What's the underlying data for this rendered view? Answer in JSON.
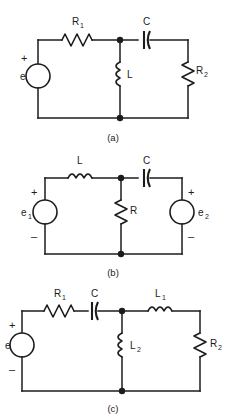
{
  "figure": {
    "type": "electrical-circuit-schematics",
    "background_color": "#ffffff",
    "line_color": "#1c1c1c",
    "panel_count": 3
  },
  "circuits": [
    {
      "id": "a",
      "caption": "(a)",
      "source": {
        "label": "e",
        "label_position": "left",
        "plus_sign": "+",
        "minus_sign": "",
        "shows_minus": false,
        "symbol": "circle-source"
      },
      "components": [
        {
          "ref": "R1",
          "label": "R",
          "subscript": "1",
          "type": "resistor",
          "orientation": "horizontal",
          "branch": "top-left",
          "label_position": "above"
        },
        {
          "ref": "C",
          "label": "C",
          "subscript": "",
          "type": "capacitor",
          "orientation": "horizontal",
          "branch": "top-right",
          "label_position": "above"
        },
        {
          "ref": "L",
          "label": "L",
          "subscript": "",
          "type": "inductor",
          "orientation": "vertical",
          "branch": "middle",
          "label_position": "right"
        },
        {
          "ref": "R2",
          "label": "R",
          "subscript": "2",
          "type": "resistor",
          "orientation": "vertical",
          "branch": "right",
          "label_position": "right"
        }
      ],
      "nodes": 2
    },
    {
      "id": "b",
      "caption": "(b)",
      "sources": [
        {
          "label": "e",
          "subscript": "1",
          "label_position": "left",
          "plus_sign": "+",
          "minus_sign": "–",
          "shows_minus": true,
          "symbol": "circle-source",
          "branch": "left"
        },
        {
          "label": "e",
          "subscript": "2",
          "label_position": "right",
          "plus_sign": "+",
          "minus_sign": "–",
          "shows_minus": true,
          "symbol": "circle-source",
          "branch": "right"
        }
      ],
      "components": [
        {
          "ref": "L",
          "label": "L",
          "subscript": "",
          "type": "inductor",
          "orientation": "horizontal",
          "branch": "top-left",
          "label_position": "above"
        },
        {
          "ref": "C",
          "label": "C",
          "subscript": "",
          "type": "capacitor",
          "orientation": "horizontal",
          "branch": "top-right",
          "label_position": "above"
        },
        {
          "ref": "R",
          "label": "R",
          "subscript": "",
          "type": "resistor",
          "orientation": "vertical",
          "branch": "middle",
          "label_position": "right"
        }
      ],
      "nodes": 2
    },
    {
      "id": "c",
      "caption": "(c)",
      "source": {
        "label": "e",
        "label_position": "left",
        "plus_sign": "+",
        "minus_sign": "–",
        "shows_minus": true,
        "symbol": "circle-source"
      },
      "components": [
        {
          "ref": "R1",
          "label": "R",
          "subscript": "1",
          "type": "resistor",
          "orientation": "horizontal",
          "branch": "top-left",
          "label_position": "above"
        },
        {
          "ref": "C",
          "label": "C",
          "subscript": "",
          "type": "capacitor",
          "orientation": "horizontal",
          "branch": "top-left",
          "label_position": "above"
        },
        {
          "ref": "L1",
          "label": "L",
          "subscript": "1",
          "type": "inductor",
          "orientation": "horizontal",
          "branch": "top-right",
          "label_position": "above"
        },
        {
          "ref": "L2",
          "label": "L",
          "subscript": "2",
          "type": "inductor",
          "orientation": "vertical",
          "branch": "middle",
          "label_position": "right"
        },
        {
          "ref": "R2",
          "label": "R",
          "subscript": "2",
          "type": "resistor",
          "orientation": "vertical",
          "branch": "right",
          "label_position": "right"
        }
      ],
      "nodes": 2
    }
  ],
  "labels": {
    "a": {
      "R1": "R",
      "R1_sub": "1",
      "C": "C",
      "L": "L",
      "R2": "R",
      "R2_sub": "2",
      "e": "e",
      "plus": "+",
      "caption": "(a)"
    },
    "b": {
      "L": "L",
      "C": "C",
      "R": "R",
      "e1": "e",
      "e1_sub": "1",
      "e2": "e",
      "e2_sub": "2",
      "plus1": "+",
      "minus1": "–",
      "plus2": "+",
      "minus2": "–",
      "caption": "(b)"
    },
    "c": {
      "R1": "R",
      "R1_sub": "1",
      "C": "C",
      "L1": "L",
      "L1_sub": "1",
      "L2": "L",
      "L2_sub": "2",
      "R2": "R",
      "R2_sub": "2",
      "e": "e",
      "plus": "+",
      "minus": "–",
      "caption": "(c)"
    }
  }
}
